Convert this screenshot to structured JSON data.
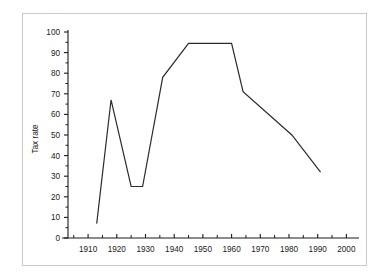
{
  "chart_data": {
    "type": "line",
    "title": "",
    "xlabel": "",
    "ylabel": "Tax rate",
    "xlim": [
      1903,
      2003
    ],
    "ylim": [
      0,
      100
    ],
    "grid": false,
    "legend": "none",
    "x_ticks": [
      1910,
      1920,
      1930,
      1940,
      1950,
      1960,
      1970,
      1980,
      1990,
      2000
    ],
    "x_tick_labels": [
      "1910",
      "1920",
      "1930",
      "1940",
      "1950",
      "1960",
      "1970",
      "1980",
      "1990",
      "2000"
    ],
    "x_minor_ticks": [
      1905,
      1915,
      1925,
      1935,
      1945,
      1955,
      1965,
      1975,
      1985,
      1995
    ],
    "y_ticks": [
      0,
      10,
      20,
      30,
      40,
      50,
      60,
      70,
      80,
      90,
      100
    ],
    "y_tick_labels": [
      "0",
      "10",
      "20",
      "30",
      "40",
      "50",
      "60",
      "70",
      "80",
      "90",
      "100"
    ],
    "series": [
      {
        "name": "Tax rate",
        "color": "#2b2b2b",
        "x": [
          1913,
          1918,
          1925,
          1929,
          1936,
          1945,
          1960,
          1964,
          1981,
          1991
        ],
        "values": [
          7,
          67,
          25,
          25,
          78,
          94.5,
          94.5,
          71,
          50,
          32
        ]
      }
    ]
  },
  "figure": {
    "border_color": "#c9c9c9",
    "background": "#ffffff",
    "axis_color": "#1a1a1a"
  }
}
